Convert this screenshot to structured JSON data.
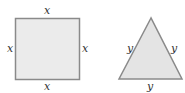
{
  "figure": {
    "square": {
      "labels": {
        "top": "x",
        "bottom": "x",
        "left": "x",
        "right": "x"
      },
      "fill": "#ebebeb",
      "stroke": "#8a8a8a"
    },
    "triangle": {
      "labels": {
        "left": "y",
        "right": "y",
        "bottom": "y"
      },
      "fill": "#e4e4e4",
      "stroke": "#8a8a8a"
    }
  }
}
